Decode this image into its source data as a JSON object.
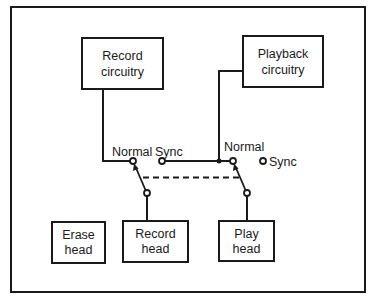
{
  "diagram": {
    "colors": {
      "line": "#1a1a1a",
      "background": "#ffffff"
    },
    "blocks": {
      "record_circuitry": {
        "line1": "Record",
        "line2": "circuitry"
      },
      "playback_circuitry": {
        "line1": "Playback",
        "line2": "circuitry"
      },
      "erase_head": {
        "line1": "Erase",
        "line2": "head"
      },
      "record_head": {
        "line1": "Record",
        "line2": "head"
      },
      "play_head": {
        "line1": "Play",
        "line2": "head"
      }
    },
    "switches": {
      "record_switch": {
        "normal_label": "Normal",
        "sync_label": "Sync"
      },
      "play_switch": {
        "normal_label": "Normal",
        "sync_label": "Sync"
      },
      "mechanical_link": "dashed ganged linkage between the two switches"
    },
    "connections": [
      "Record circuitry -> Record switch Normal contact",
      "Record switch pivot -> Record head",
      "Record switch Sync contact -> Playback circuitry",
      "Playback circuitry -> Play switch Normal contact",
      "Play switch pivot -> Play head"
    ]
  }
}
